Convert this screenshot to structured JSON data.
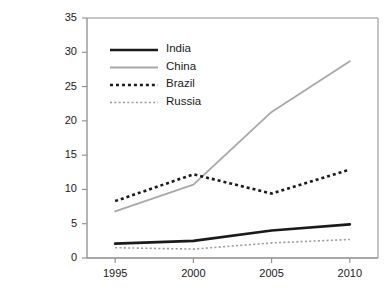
{
  "chart_data": {
    "type": "line",
    "title": "",
    "subtitle": "",
    "xlabel": "",
    "ylabel": "",
    "x": [
      1995,
      2000,
      2005,
      2010
    ],
    "categories": [
      "1995",
      "2000",
      "2005",
      "2010"
    ],
    "xlim": [
      1993.2,
      2011.8
    ],
    "ylim": [
      0,
      35
    ],
    "yticks": [
      0,
      5,
      10,
      15,
      20,
      25,
      30,
      35
    ],
    "ytick_labels": [
      "0",
      "5",
      "10",
      "15",
      "20",
      "25",
      "30",
      "35"
    ],
    "xticks": [
      1995,
      2000,
      2005,
      2010
    ],
    "xtick_labels": [
      "1995",
      "2000",
      "2005",
      "2010"
    ],
    "grid": false,
    "legend_position": "upper-left-inside",
    "series": [
      {
        "name": "India",
        "values": [
          2.1,
          2.5,
          4.0,
          4.9
        ],
        "color": "#1a1a1a",
        "style": "solid",
        "width": 2.6
      },
      {
        "name": "China",
        "values": [
          6.8,
          10.7,
          21.3,
          28.7
        ],
        "color": "#a8a8a8",
        "style": "solid",
        "width": 1.8
      },
      {
        "name": "Brazil",
        "values": [
          8.3,
          12.2,
          9.4,
          12.9
        ],
        "color": "#1a1a1a",
        "style": "dotted-thick",
        "width": 2.6
      },
      {
        "name": "Russia",
        "values": [
          1.5,
          1.3,
          2.2,
          2.7
        ],
        "color": "#9a9a9a",
        "style": "dotted-thin",
        "width": 1.6
      }
    ],
    "axis_color": "#8c8c8c",
    "text_color": "#1a1a1a",
    "background": "#ffffff"
  },
  "legend": {
    "items": [
      {
        "label": "India"
      },
      {
        "label": "China"
      },
      {
        "label": "Brazil"
      },
      {
        "label": "Russia"
      }
    ]
  },
  "axes": {
    "y_labels": [
      "35",
      "30",
      "25",
      "20",
      "15",
      "10",
      "5",
      "0"
    ],
    "x_labels": [
      "1995",
      "2000",
      "2005",
      "2010"
    ]
  }
}
